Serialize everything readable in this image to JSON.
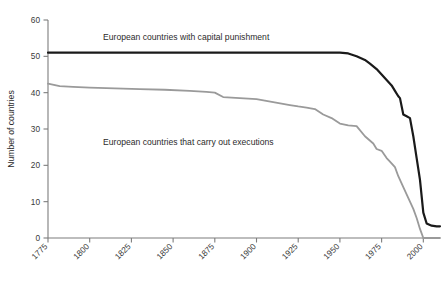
{
  "chart_data": {
    "type": "line",
    "title": "",
    "xlabel": "",
    "ylabel": "Number of countries",
    "xlim": [
      1775,
      2010
    ],
    "ylim": [
      0,
      60
    ],
    "grid": false,
    "legend_position": "inline-annotation",
    "xticks": [
      1775,
      1800,
      1825,
      1850,
      1875,
      1900,
      1925,
      1950,
      1975,
      2000
    ],
    "xticklabels": [
      "1775",
      "1800",
      "1825",
      "1850",
      "1875",
      "1900",
      "1925",
      "1950",
      "1975",
      "2000"
    ],
    "yticks": [
      0,
      10,
      20,
      30,
      40,
      50,
      60
    ],
    "yticklabels": [
      "0",
      "10",
      "20",
      "30",
      "40",
      "50",
      "60"
    ],
    "annotations": [
      {
        "text": "European countries with capital punishment",
        "x": 1808,
        "y": 54.5
      },
      {
        "text": "European countries that carry out executions",
        "x": 1808,
        "y": 25.5
      }
    ],
    "series": [
      {
        "name": "European countries with capital punishment",
        "color": "#1a1a1a",
        "x": [
          1775,
          1800,
          1825,
          1850,
          1875,
          1900,
          1925,
          1940,
          1950,
          1955,
          1960,
          1965,
          1968,
          1972,
          1975,
          1978,
          1981,
          1983,
          1985,
          1986,
          1988,
          1990,
          1992,
          1994,
          1996,
          1998,
          2000,
          2002,
          2005,
          2008,
          2010
        ],
        "values": [
          51,
          51,
          51,
          51,
          51,
          51,
          51,
          51,
          51,
          50.8,
          50,
          49,
          48,
          46.5,
          45,
          43.5,
          42,
          40.5,
          39,
          38.5,
          34,
          33.5,
          33,
          28,
          22,
          16,
          7,
          4,
          3.4,
          3.2,
          3.2
        ]
      },
      {
        "name": "European countries that carry out executions",
        "color": "#9a9a9a",
        "x": [
          1775,
          1782,
          1790,
          1800,
          1815,
          1830,
          1845,
          1860,
          1870,
          1875,
          1880,
          1890,
          1900,
          1905,
          1910,
          1920,
          1925,
          1930,
          1935,
          1940,
          1945,
          1950,
          1955,
          1960,
          1965,
          1970,
          1972,
          1975,
          1978,
          1980,
          1983,
          1985,
          1988,
          1990,
          1992,
          1994,
          1996,
          1998,
          2000,
          2010
        ],
        "values": [
          42.5,
          41.8,
          41.6,
          41.4,
          41.2,
          41,
          40.8,
          40.5,
          40.2,
          40,
          38.8,
          38.5,
          38.2,
          37.8,
          37.4,
          36.6,
          36.2,
          35.9,
          35.5,
          34,
          33,
          31.5,
          31,
          30.8,
          28,
          26,
          24.5,
          24,
          22,
          21,
          19.5,
          17,
          14,
          12,
          10,
          8,
          5.5,
          2.5,
          0,
          0
        ]
      }
    ]
  }
}
